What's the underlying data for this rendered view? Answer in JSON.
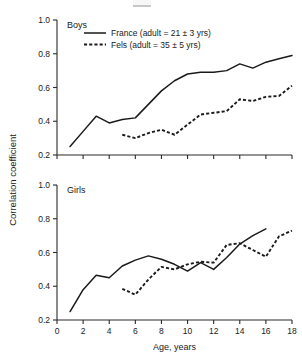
{
  "figure": {
    "y_axis_label": "Correlation coefficient",
    "x_axis_label": "Age, years"
  },
  "legend": {
    "entries": [
      {
        "label": "France (adult = 21 ± 3 yrs)",
        "style": "solid",
        "name": "france"
      },
      {
        "label": "Fels (adult = 35 ± 5 yrs)",
        "style": "dashed",
        "name": "fels"
      }
    ]
  },
  "panels": [
    {
      "id": "boys",
      "title": "Boys"
    },
    {
      "id": "girls",
      "title": "Girls"
    }
  ],
  "chart_data": [
    {
      "type": "line",
      "title": "Boys",
      "xlabel": "",
      "ylabel": "Correlation coefficient",
      "xlim": [
        0,
        18
      ],
      "ylim": [
        0.2,
        1.0
      ],
      "xticks": [
        0,
        2,
        4,
        6,
        8,
        10,
        12,
        14,
        16,
        18
      ],
      "xticklabels": [
        "",
        "",
        "",
        "",
        "",
        "",
        "",
        "",
        "",
        ""
      ],
      "yticks": [
        0.2,
        0.4,
        0.6,
        0.8,
        1.0
      ],
      "yticklabels": [
        "0.2",
        "0.4",
        "0.6",
        "0.8",
        "1.0"
      ],
      "grid": false,
      "legend_position": "top-left",
      "series": [
        {
          "name": "France (adult = 21 ± 3 yrs)",
          "style": "solid",
          "x": [
            1,
            2,
            3,
            4,
            5,
            6,
            7,
            8,
            9,
            10,
            11,
            12,
            13,
            14,
            15,
            16,
            17,
            18
          ],
          "values": [
            0.25,
            0.34,
            0.43,
            0.39,
            0.41,
            0.42,
            0.5,
            0.58,
            0.64,
            0.68,
            0.69,
            0.69,
            0.7,
            0.74,
            0.715,
            0.75,
            0.77,
            0.79
          ]
        },
        {
          "name": "Fels (adult = 35 ± 5 yrs)",
          "style": "dashed",
          "x": [
            5,
            6,
            7,
            8,
            9,
            10,
            11,
            12,
            13,
            14,
            15,
            16,
            17,
            18
          ],
          "values": [
            0.32,
            0.3,
            0.33,
            0.35,
            0.32,
            0.38,
            0.44,
            0.45,
            0.46,
            0.53,
            0.52,
            0.545,
            0.55,
            0.61
          ]
        }
      ]
    },
    {
      "type": "line",
      "title": "Girls",
      "xlabel": "Age, years",
      "ylabel": "Correlation coefficient",
      "xlim": [
        0,
        18
      ],
      "ylim": [
        0.2,
        1.0
      ],
      "xticks": [
        0,
        2,
        4,
        6,
        8,
        10,
        12,
        14,
        16,
        18
      ],
      "xticklabels": [
        "0",
        "2",
        "4",
        "6",
        "8",
        "10",
        "12",
        "14",
        "16",
        "18"
      ],
      "yticks": [
        0.2,
        0.4,
        0.6,
        0.8,
        1.0
      ],
      "yticklabels": [
        "0.2",
        "0.4",
        "0.6",
        "0.8",
        "1.0"
      ],
      "grid": false,
      "legend_position": "none",
      "series": [
        {
          "name": "France (adult = 21 ± 3 yrs)",
          "style": "solid",
          "x": [
            1,
            2,
            3,
            4,
            5,
            6,
            7,
            8,
            9,
            10,
            11,
            12,
            13,
            14,
            15,
            16
          ],
          "values": [
            0.25,
            0.38,
            0.465,
            0.45,
            0.52,
            0.555,
            0.58,
            0.56,
            0.53,
            0.49,
            0.54,
            0.5,
            0.57,
            0.65,
            0.7,
            0.74
          ]
        },
        {
          "name": "Fels (adult = 35 ± 5 yrs)",
          "style": "dashed",
          "x": [
            5,
            6,
            7,
            8,
            9,
            10,
            11,
            12,
            13,
            14,
            15,
            16,
            17,
            18
          ],
          "values": [
            0.385,
            0.35,
            0.44,
            0.515,
            0.5,
            0.53,
            0.545,
            0.54,
            0.645,
            0.655,
            0.615,
            0.575,
            0.695,
            0.73
          ]
        }
      ]
    }
  ]
}
